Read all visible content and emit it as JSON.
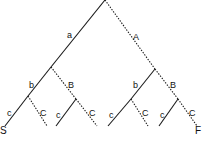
{
  "diagram": {
    "type": "binary-tree",
    "style": {
      "line_color": "#1a1a1a",
      "background": "#ffffff",
      "solid_meaning": "lowercase branch",
      "dotted_meaning": "uppercase branch"
    },
    "edge_labels": {
      "root_left": "a",
      "root_right": "A",
      "l_left": "b",
      "l_right": "B",
      "r_left": "b",
      "r_right": "B",
      "ll_left": "c",
      "ll_right": "C",
      "lr_left": "c",
      "lr_right": "C",
      "rl_left": "c",
      "rl_right": "C",
      "rr_left": "c",
      "rr_right": "C"
    },
    "leaf_labels": {
      "start": "S",
      "finish": "F"
    }
  }
}
